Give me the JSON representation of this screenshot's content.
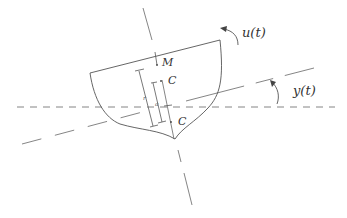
{
  "diagram": {
    "type": "ship stability cross-section (roll)",
    "labels": {
      "metacenter": "M",
      "center_upper": "C",
      "center_lower": "C",
      "dim_r": "r",
      "dim_a": "a",
      "input": "u(t)",
      "output": "y(t)"
    },
    "colors": {
      "line": "#555555",
      "background": "#ffffff"
    }
  }
}
